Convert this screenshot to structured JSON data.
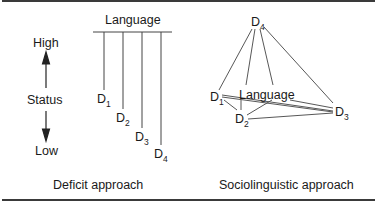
{
  "figure": {
    "left_panel": {
      "caption": "Deficit approach",
      "top_label": "Language",
      "axis": {
        "title": "Status",
        "high": "High",
        "low": "Low"
      },
      "dialects": [
        {
          "letter": "D",
          "index": "1"
        },
        {
          "letter": "D",
          "index": "2"
        },
        {
          "letter": "D",
          "index": "3"
        },
        {
          "letter": "D",
          "index": "4"
        }
      ]
    },
    "right_panel": {
      "caption": "Sociolinguistic approach",
      "center_label": "Language",
      "dialects": [
        {
          "letter": "D",
          "index": "1"
        },
        {
          "letter": "D",
          "index": "2"
        },
        {
          "letter": "D",
          "index": "3"
        },
        {
          "letter": "D",
          "index": "4"
        }
      ]
    },
    "colors": {
      "line": "#3a3a3a",
      "text": "#1a1a1a"
    }
  }
}
